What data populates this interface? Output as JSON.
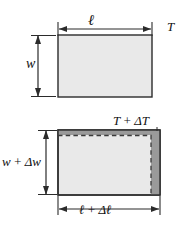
{
  "figure": {
    "panels": [
      {
        "id": "before",
        "description": "Rectangular plate at initial temperature",
        "temperature_label": "T",
        "width_label": "w",
        "length_label": "ℓ",
        "fill_color": "#e9e9e9",
        "outline_color": "#2b2b2b"
      },
      {
        "id": "after",
        "description": "Expanded rectangular plate at raised temperature",
        "temperature_label": "T + ΔT",
        "width_label": "w + Δw",
        "length_label": "ℓ + Δℓ",
        "fill_color": "#e9e9e9",
        "expansion_band_color": "#9a9a9a",
        "original_outline_style": "dashed",
        "outline_color": "#2b2b2b"
      }
    ],
    "colors": {
      "plate_fill": "#e9e9e9",
      "expansion_band": "#9a9a9a",
      "stroke": "#2b2b2b",
      "background": "#ffffff",
      "dashed_stroke": "#3a3a3a"
    }
  }
}
